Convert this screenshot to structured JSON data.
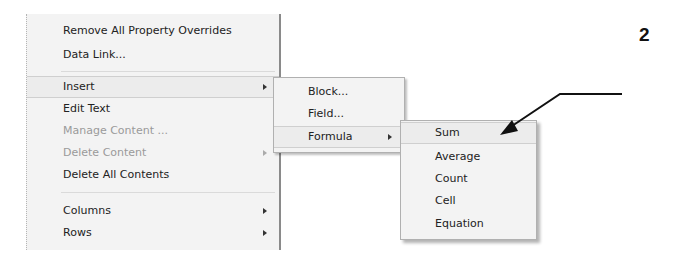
{
  "main_menu": {
    "items": [
      {
        "label": "Remove All Property Overrides",
        "enabled": true,
        "submenu": false
      },
      {
        "label": "Data Link...",
        "enabled": true,
        "submenu": false
      },
      {
        "label": "Insert",
        "enabled": true,
        "submenu": true,
        "highlighted": true
      },
      {
        "label": "Edit Text",
        "enabled": true,
        "submenu": false
      },
      {
        "label": "Manage Content ...",
        "enabled": false,
        "submenu": false
      },
      {
        "label": "Delete Content",
        "enabled": false,
        "submenu": true
      },
      {
        "label": "Delete All Contents",
        "enabled": true,
        "submenu": false
      },
      {
        "label": "Columns",
        "enabled": true,
        "submenu": true
      },
      {
        "label": "Rows",
        "enabled": true,
        "submenu": true
      }
    ]
  },
  "insert_submenu": {
    "items": [
      {
        "label": "Block...",
        "submenu": false
      },
      {
        "label": "Field...",
        "submenu": false
      },
      {
        "label": "Formula",
        "submenu": true,
        "highlighted": true
      }
    ]
  },
  "formula_submenu": {
    "items": [
      {
        "label": "Sum",
        "highlighted": true
      },
      {
        "label": "Average"
      },
      {
        "label": "Count"
      },
      {
        "label": "Cell"
      },
      {
        "label": "Equation"
      }
    ]
  },
  "callout": {
    "number": "2",
    "target": "Sum"
  }
}
